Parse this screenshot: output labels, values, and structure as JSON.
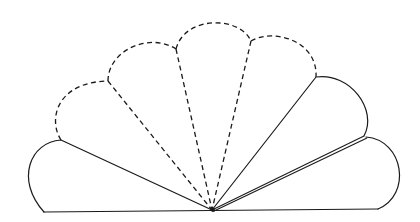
{
  "diagram": {
    "colors": {
      "line": "#1a1a1a",
      "background": "#ffffff"
    },
    "lobes": [
      {
        "id": "lobe-left-solid",
        "style": "solid",
        "position": "leftmost, resting on baseline"
      },
      {
        "id": "lobe-1-dashed",
        "style": "dashed",
        "position": "second from left"
      },
      {
        "id": "lobe-2-dashed",
        "style": "dashed",
        "position": "center-left"
      },
      {
        "id": "lobe-3-dashed",
        "style": "dashed",
        "position": "center-right"
      },
      {
        "id": "lobe-upper-right-solid",
        "style": "solid",
        "position": "second from right"
      },
      {
        "id": "lobe-right-solid",
        "style": "solid",
        "position": "rightmost, resting on baseline"
      }
    ],
    "pivot": "common hinge point at bottom center",
    "double_line": "between the two right solid lobes"
  }
}
